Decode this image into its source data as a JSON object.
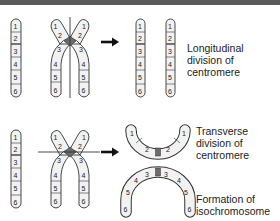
{
  "diagram": {
    "segments": [
      "1",
      "2",
      "3",
      "4",
      "5",
      "6"
    ],
    "rows": [
      {
        "id": "longitudinal",
        "description": "Longitudinal division of centromere",
        "label_lines": [
          "Longitudinal",
          "division of",
          "centromere"
        ]
      },
      {
        "id": "transverse",
        "description": "Transverse division of centromere",
        "label_lines": [
          "Transverse",
          "division of",
          "centromere"
        ]
      },
      {
        "id": "isochromosome",
        "description": "Formation of isochromosome",
        "label_lines": [
          "Formation of",
          "isochromosome"
        ]
      }
    ],
    "arrows": [
      {
        "from": "x-chromosome-top",
        "to": "separated-chromatids",
        "icon": "right-arrow-icon"
      },
      {
        "from": "x-chromosome-bottom",
        "to": "arc-chromosomes",
        "icon": "right-arrow-icon"
      }
    ]
  },
  "colors": {
    "topbar": "#5a5a5a",
    "chromosome_fill": "#f2f2f2",
    "chromosome_stroke": "#333333",
    "centromere": "#6b6b6b",
    "division_line": "#333333"
  }
}
